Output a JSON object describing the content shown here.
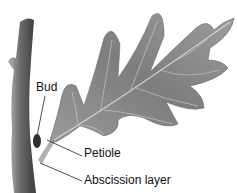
{
  "diagram": {
    "labels": [
      {
        "id": "bud",
        "text": "Bud"
      },
      {
        "id": "petiole",
        "text": "Petiole"
      },
      {
        "id": "abscission",
        "text": "Abscission layer"
      }
    ],
    "colors": {
      "leaf": "#8c8c8c",
      "leaf_dark": "#6e6e6e",
      "vein": "#c8c8c8",
      "stem": "#7a7a7a",
      "leader_line": "#222222"
    }
  }
}
